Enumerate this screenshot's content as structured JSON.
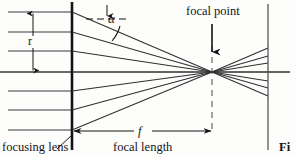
{
  "figure": {
    "caption_fragment": "Fi",
    "labels": {
      "beam_radius": "r",
      "convergence_angle": "α",
      "focal_point": "focal point",
      "focal_length_symbol": "f",
      "focal_length_name": "focal length",
      "lens": "focusing lens"
    },
    "colors": {
      "ink": "#141414",
      "ray": "#3a3a3a",
      "background": "#fdfdfc"
    },
    "geometry": {
      "lens_x": 72,
      "focal_point_x": 212,
      "right_plane_x": 268,
      "axis_y": 72,
      "ray_y_positions": [
        12,
        32,
        51,
        72,
        91,
        110,
        130
      ],
      "ray_count": 7,
      "dimension_line_y": 131,
      "focal_point_arrow_x": 212
    }
  }
}
